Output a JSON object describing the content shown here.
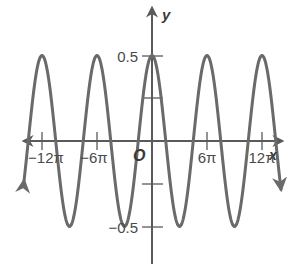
{
  "chart_data": {
    "type": "line",
    "title": "",
    "function": "y = 0.5 cos(x/3)",
    "xlabel": "x",
    "ylabel": "y",
    "origin_label": "O",
    "x_ticks": [
      {
        "value": -37.699,
        "label": "−12π"
      },
      {
        "value": -18.85,
        "label": "−6π"
      },
      {
        "value": 18.85,
        "label": "6π"
      },
      {
        "value": 37.699,
        "label": "12π"
      }
    ],
    "y_ticks": [
      {
        "value": 0.5,
        "label": "0.5"
      },
      {
        "value": 0.25,
        "label": ""
      },
      {
        "value": -0.25,
        "label": ""
      },
      {
        "value": -0.5,
        "label": "−0.5"
      }
    ],
    "xlim": [
      -43.98,
      43.98
    ],
    "ylim": [
      -0.78,
      0.78
    ],
    "grid": false,
    "amplitude": 0.5,
    "period": "6π",
    "series": [
      {
        "name": "y = 0.5cos(x/3)",
        "color": "#6a6a6a",
        "points": [
          {
            "x": "-12π",
            "y": 0.5
          },
          {
            "x": "-9π",
            "y": -0.5
          },
          {
            "x": "-6π",
            "y": 0.5
          },
          {
            "x": "-3π",
            "y": -0.5
          },
          {
            "x": "0",
            "y": 0.5
          },
          {
            "x": "3π",
            "y": -0.5
          },
          {
            "x": "6π",
            "y": 0.5
          },
          {
            "x": "9π",
            "y": -0.5
          },
          {
            "x": "12π",
            "y": 0.5
          }
        ]
      }
    ]
  },
  "labels": {
    "y_axis": "y",
    "x_axis": "x",
    "origin": "O",
    "y_pos": "0.5",
    "y_neg": "−0.5",
    "x_neg12": "−12π",
    "x_neg6": "−6π",
    "x_pos6": "6π",
    "x_pos12": "12π"
  },
  "colors": {
    "curve": "#6a6a6a",
    "axis": "#5a5a5a",
    "text": "#4a4a4a"
  }
}
